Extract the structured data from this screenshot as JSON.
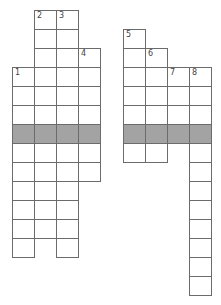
{
  "puzzle": {
    "type": "crossword",
    "cell_width": 22,
    "row_height": 19,
    "origin_top": 10,
    "shaded_row": 6,
    "colors": {
      "border": "#6b6b6b",
      "shaded": "#a3a3a3",
      "cell": "#ffffff"
    },
    "columns": [
      {
        "id": "A",
        "x": 12,
        "start_row": 3,
        "end_row": 12,
        "number": "1"
      },
      {
        "id": "B",
        "x": 34,
        "start_row": 0,
        "end_row": 11,
        "number": "2"
      },
      {
        "id": "C",
        "x": 56,
        "start_row": 0,
        "end_row": 12,
        "number": "3"
      },
      {
        "id": "D",
        "x": 78,
        "start_row": 2,
        "end_row": 8,
        "number": "4"
      },
      {
        "id": "E",
        "x": 123,
        "start_row": 1,
        "end_row": 7,
        "number": "5"
      },
      {
        "id": "F",
        "x": 145,
        "start_row": 2,
        "end_row": 7,
        "number": "6"
      },
      {
        "id": "G",
        "x": 167,
        "start_row": 3,
        "end_row": 6,
        "number": "7"
      },
      {
        "id": "H",
        "x": 189,
        "start_row": 3,
        "end_row": 14,
        "number": "8"
      }
    ]
  }
}
